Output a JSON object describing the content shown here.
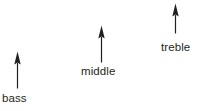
{
  "canvas": {
    "width": 199,
    "height": 111,
    "background": "#ffffff",
    "ink": "#231f20"
  },
  "diagram": {
    "bands": [
      {
        "id": "bass",
        "label": "bass",
        "arrow_direction": "up",
        "arrow_length_px": 37,
        "arrow_x_px": 17,
        "arrow_tip_y_px": 51,
        "arrow_tail_y_px": 88,
        "label_x_px": 2,
        "label_y_px": 92
      },
      {
        "id": "middle",
        "label": "middle",
        "arrow_direction": "up",
        "arrow_length_px": 37,
        "arrow_x_px": 101,
        "arrow_tip_y_px": 25,
        "arrow_tail_y_px": 62,
        "label_x_px": 81,
        "label_y_px": 65
      },
      {
        "id": "treble",
        "label": "treble",
        "arrow_direction": "up",
        "arrow_length_px": 30,
        "arrow_x_px": 175,
        "arrow_tip_y_px": 3,
        "arrow_tail_y_px": 33,
        "label_x_px": 161,
        "label_y_px": 41
      }
    ]
  }
}
